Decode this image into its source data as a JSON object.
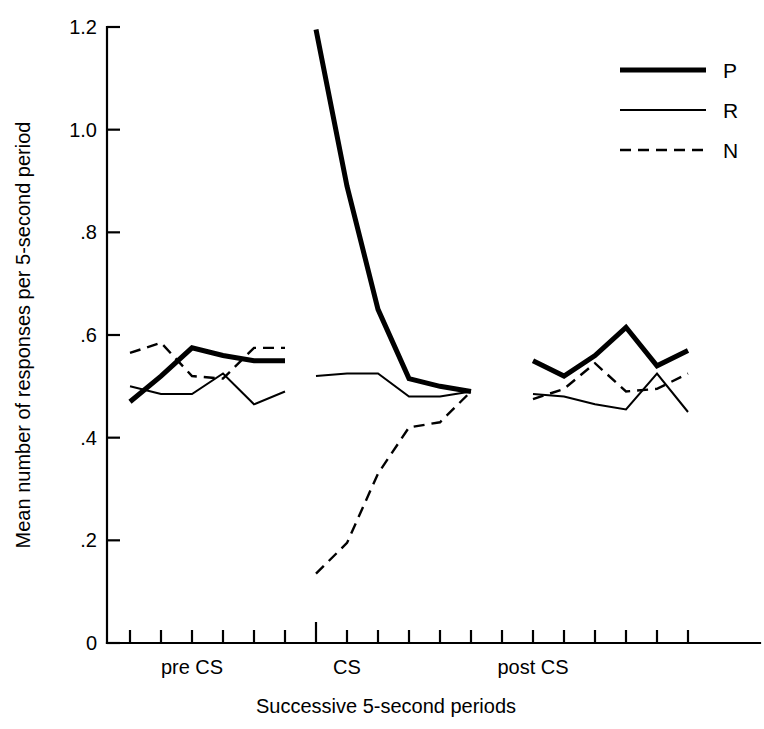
{
  "chart_data": {
    "type": "line",
    "title": "",
    "xlabel": "Successive 5-second periods",
    "ylabel": "Mean number of responses per 5-second period",
    "ylim": [
      0,
      1.2
    ],
    "ytick_labels": [
      "0",
      ".2",
      ".4",
      ".6",
      ".8",
      "1.0",
      "1.2"
    ],
    "ytick_values": [
      0,
      0.2,
      0.4,
      0.6,
      0.8,
      1.0,
      1.2
    ],
    "grid": false,
    "legend_position": "top-right",
    "x_category_labels": [
      "pre CS",
      "CS",
      "post CS"
    ],
    "x_category_tick_index": [
      2,
      7,
      13
    ],
    "x_tick_count": 19,
    "x_note": "19 evenly spaced unlabeled period ticks; three labeled blocks of six successive 5-second periods separated by gaps",
    "segments": [
      {
        "name": "pre CS",
        "x_indices": [
          0,
          1,
          2,
          3,
          4,
          5
        ],
        "series": [
          {
            "name": "P",
            "values": [
              0.47,
              0.52,
              0.575,
              0.56,
              0.55,
              0.55
            ]
          },
          {
            "name": "R",
            "values": [
              0.5,
              0.485,
              0.485,
              0.525,
              0.465,
              0.49
            ]
          },
          {
            "name": "N",
            "values": [
              0.565,
              0.585,
              0.52,
              0.515,
              0.575,
              0.575
            ]
          }
        ]
      },
      {
        "name": "CS",
        "x_indices": [
          6,
          7,
          8,
          9,
          10,
          11
        ],
        "series": [
          {
            "name": "P",
            "values": [
              1.195,
              0.89,
              0.65,
              0.515,
              0.5,
              0.49
            ]
          },
          {
            "name": "R",
            "values": [
              0.52,
              0.525,
              0.525,
              0.48,
              0.48,
              0.49
            ]
          },
          {
            "name": "N",
            "values": [
              0.135,
              0.195,
              0.33,
              0.42,
              0.43,
              0.49
            ]
          }
        ]
      },
      {
        "name": "post CS",
        "x_indices": [
          13,
          14,
          15,
          16,
          17,
          18
        ],
        "series": [
          {
            "name": "P",
            "values": [
              0.55,
              0.52,
              0.56,
              0.615,
              0.54,
              0.57
            ]
          },
          {
            "name": "R",
            "values": [
              0.485,
              0.48,
              0.465,
              0.455,
              0.525,
              0.45
            ]
          },
          {
            "name": "N",
            "values": [
              0.475,
              0.495,
              0.545,
              0.49,
              0.495,
              0.525
            ]
          }
        ]
      }
    ],
    "legend": [
      {
        "key": "P",
        "label": "P",
        "style": "thick-solid"
      },
      {
        "key": "R",
        "label": "R",
        "style": "thin-solid"
      },
      {
        "key": "N",
        "label": "N",
        "style": "dashed"
      }
    ]
  }
}
